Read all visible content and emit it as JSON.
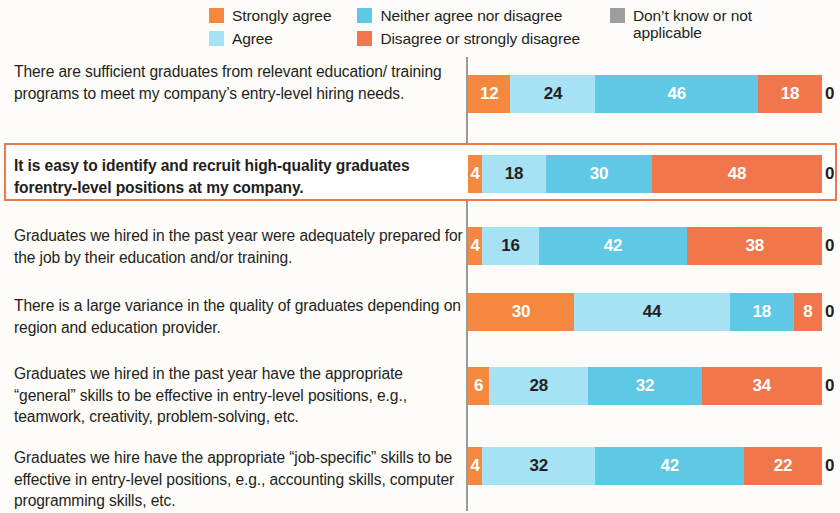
{
  "legend": {
    "columns": [
      {
        "items": [
          {
            "label": "Strongly agree",
            "color": "#f5883f",
            "icon": "legend-swatch-strongly-agree",
            "wrap": false
          },
          {
            "label": "Agree",
            "color": "#a6e1f4",
            "icon": "legend-swatch-agree",
            "wrap": false
          }
        ]
      },
      {
        "items": [
          {
            "label": "Neither agree nor disagree",
            "color": "#5ec8e5",
            "icon": "legend-swatch-neither",
            "wrap": false
          },
          {
            "label": "Disagree or strongly disagree",
            "color": "#f2764b",
            "icon": "legend-swatch-disagree",
            "wrap": false
          }
        ]
      },
      {
        "items": [
          {
            "label": "Don’t know or not applicable",
            "color": "#9d9d9d",
            "icon": "legend-swatch-dont-know",
            "wrap": true
          }
        ]
      }
    ]
  },
  "chart_data": {
    "type": "bar",
    "subtype": "stacked-horizontal-100pct",
    "title": "",
    "xlabel": "",
    "ylabel": "",
    "xlim": [
      0,
      100
    ],
    "grid": false,
    "legend_position": "top",
    "value_unit": "percent",
    "series": [
      {
        "name": "Strongly agree",
        "color": "#f5883f",
        "text_color": "#ffffff",
        "values": [
          12,
          4,
          4,
          30,
          6,
          4
        ]
      },
      {
        "name": "Agree",
        "color": "#a6e1f4",
        "text_color": "#231f20",
        "values": [
          24,
          18,
          16,
          44,
          28,
          32
        ]
      },
      {
        "name": "Neither agree nor disagree",
        "color": "#5ec8e5",
        "text_color": "#ffffff",
        "values": [
          46,
          30,
          42,
          18,
          32,
          42
        ]
      },
      {
        "name": "Disagree or strongly disagree",
        "color": "#f2764b",
        "text_color": "#ffffff",
        "values": [
          18,
          48,
          38,
          8,
          34,
          22
        ]
      },
      {
        "name": "Don’t know or not applicable",
        "color": "#9d9d9d",
        "text_color": "#231f20",
        "values": [
          0,
          0,
          0,
          0,
          0,
          0
        ]
      }
    ],
    "categories": [
      "There are sufficient graduates from relevant education/ training programs to meet my company’s entry-level hiring needs.",
      "It is easy to identify and recruit high-quality graduates forentry-level positions at my company.",
      "Graduates we hired in the past year were adequately prepared for the job by their education and/or training.",
      "There is a large variance in the quality of graduates depending on region and education provider.",
      "Graduates we hired in the past year have the appropriate “general” skills to be effective in entry-level positions, e.g., teamwork, creativity, problem-solving, etc.",
      "Graduates we hire have the appropriate “job-specific” skills to be effective in entry-level positions, e.g., accounting skills, computer programming skills, etc."
    ],
    "highlighted_category_index": 1
  },
  "rows": [
    {
      "label": "There are sufficient graduates from relevant education/ training programs to meet my company’s entry-level hiring needs.",
      "values": [
        12,
        24,
        46,
        18,
        0
      ],
      "zero": "0",
      "highlight": false
    },
    {
      "label": "It is easy to identify and recruit high-quality graduates forentry-level positions at my company.",
      "values": [
        4,
        18,
        30,
        48,
        0
      ],
      "zero": "0",
      "highlight": true
    },
    {
      "label": "Graduates we hired in the past year were adequately prepared for the job by their education and/or training.",
      "values": [
        4,
        16,
        42,
        38,
        0
      ],
      "zero": "0",
      "highlight": false
    },
    {
      "label": "There is a large variance in the quality of graduates depending on region and education provider.",
      "values": [
        30,
        44,
        18,
        8,
        0
      ],
      "zero": "0",
      "highlight": false
    },
    {
      "label": "Graduates we hired in the past year have the appropriate “general” skills to be effective in entry-level positions, e.g., teamwork, creativity, problem-solving, etc.",
      "values": [
        6,
        28,
        32,
        34,
        0
      ],
      "zero": "0",
      "highlight": false
    },
    {
      "label": "Graduates we hire have the appropriate “job-specific” skills to be effective in entry-level positions, e.g., accounting skills, computer programming skills, etc.",
      "values": [
        4,
        32,
        42,
        22,
        0
      ],
      "zero": "0",
      "highlight": false
    }
  ],
  "layout": {
    "row_tops": [
      6,
      96,
      166,
      238,
      306,
      390
    ],
    "row_label_tops": [
      6,
      100,
      170,
      240,
      308,
      392
    ],
    "bar_tops": [
      20,
      100,
      172,
      238,
      312,
      392
    ],
    "highlight_box": {
      "top": 88,
      "height": 58
    }
  },
  "colors": {
    "background": "#fdfcf9",
    "axis": "#9a9a99",
    "highlight_border": "#ec7a45",
    "text": "#231f20"
  }
}
